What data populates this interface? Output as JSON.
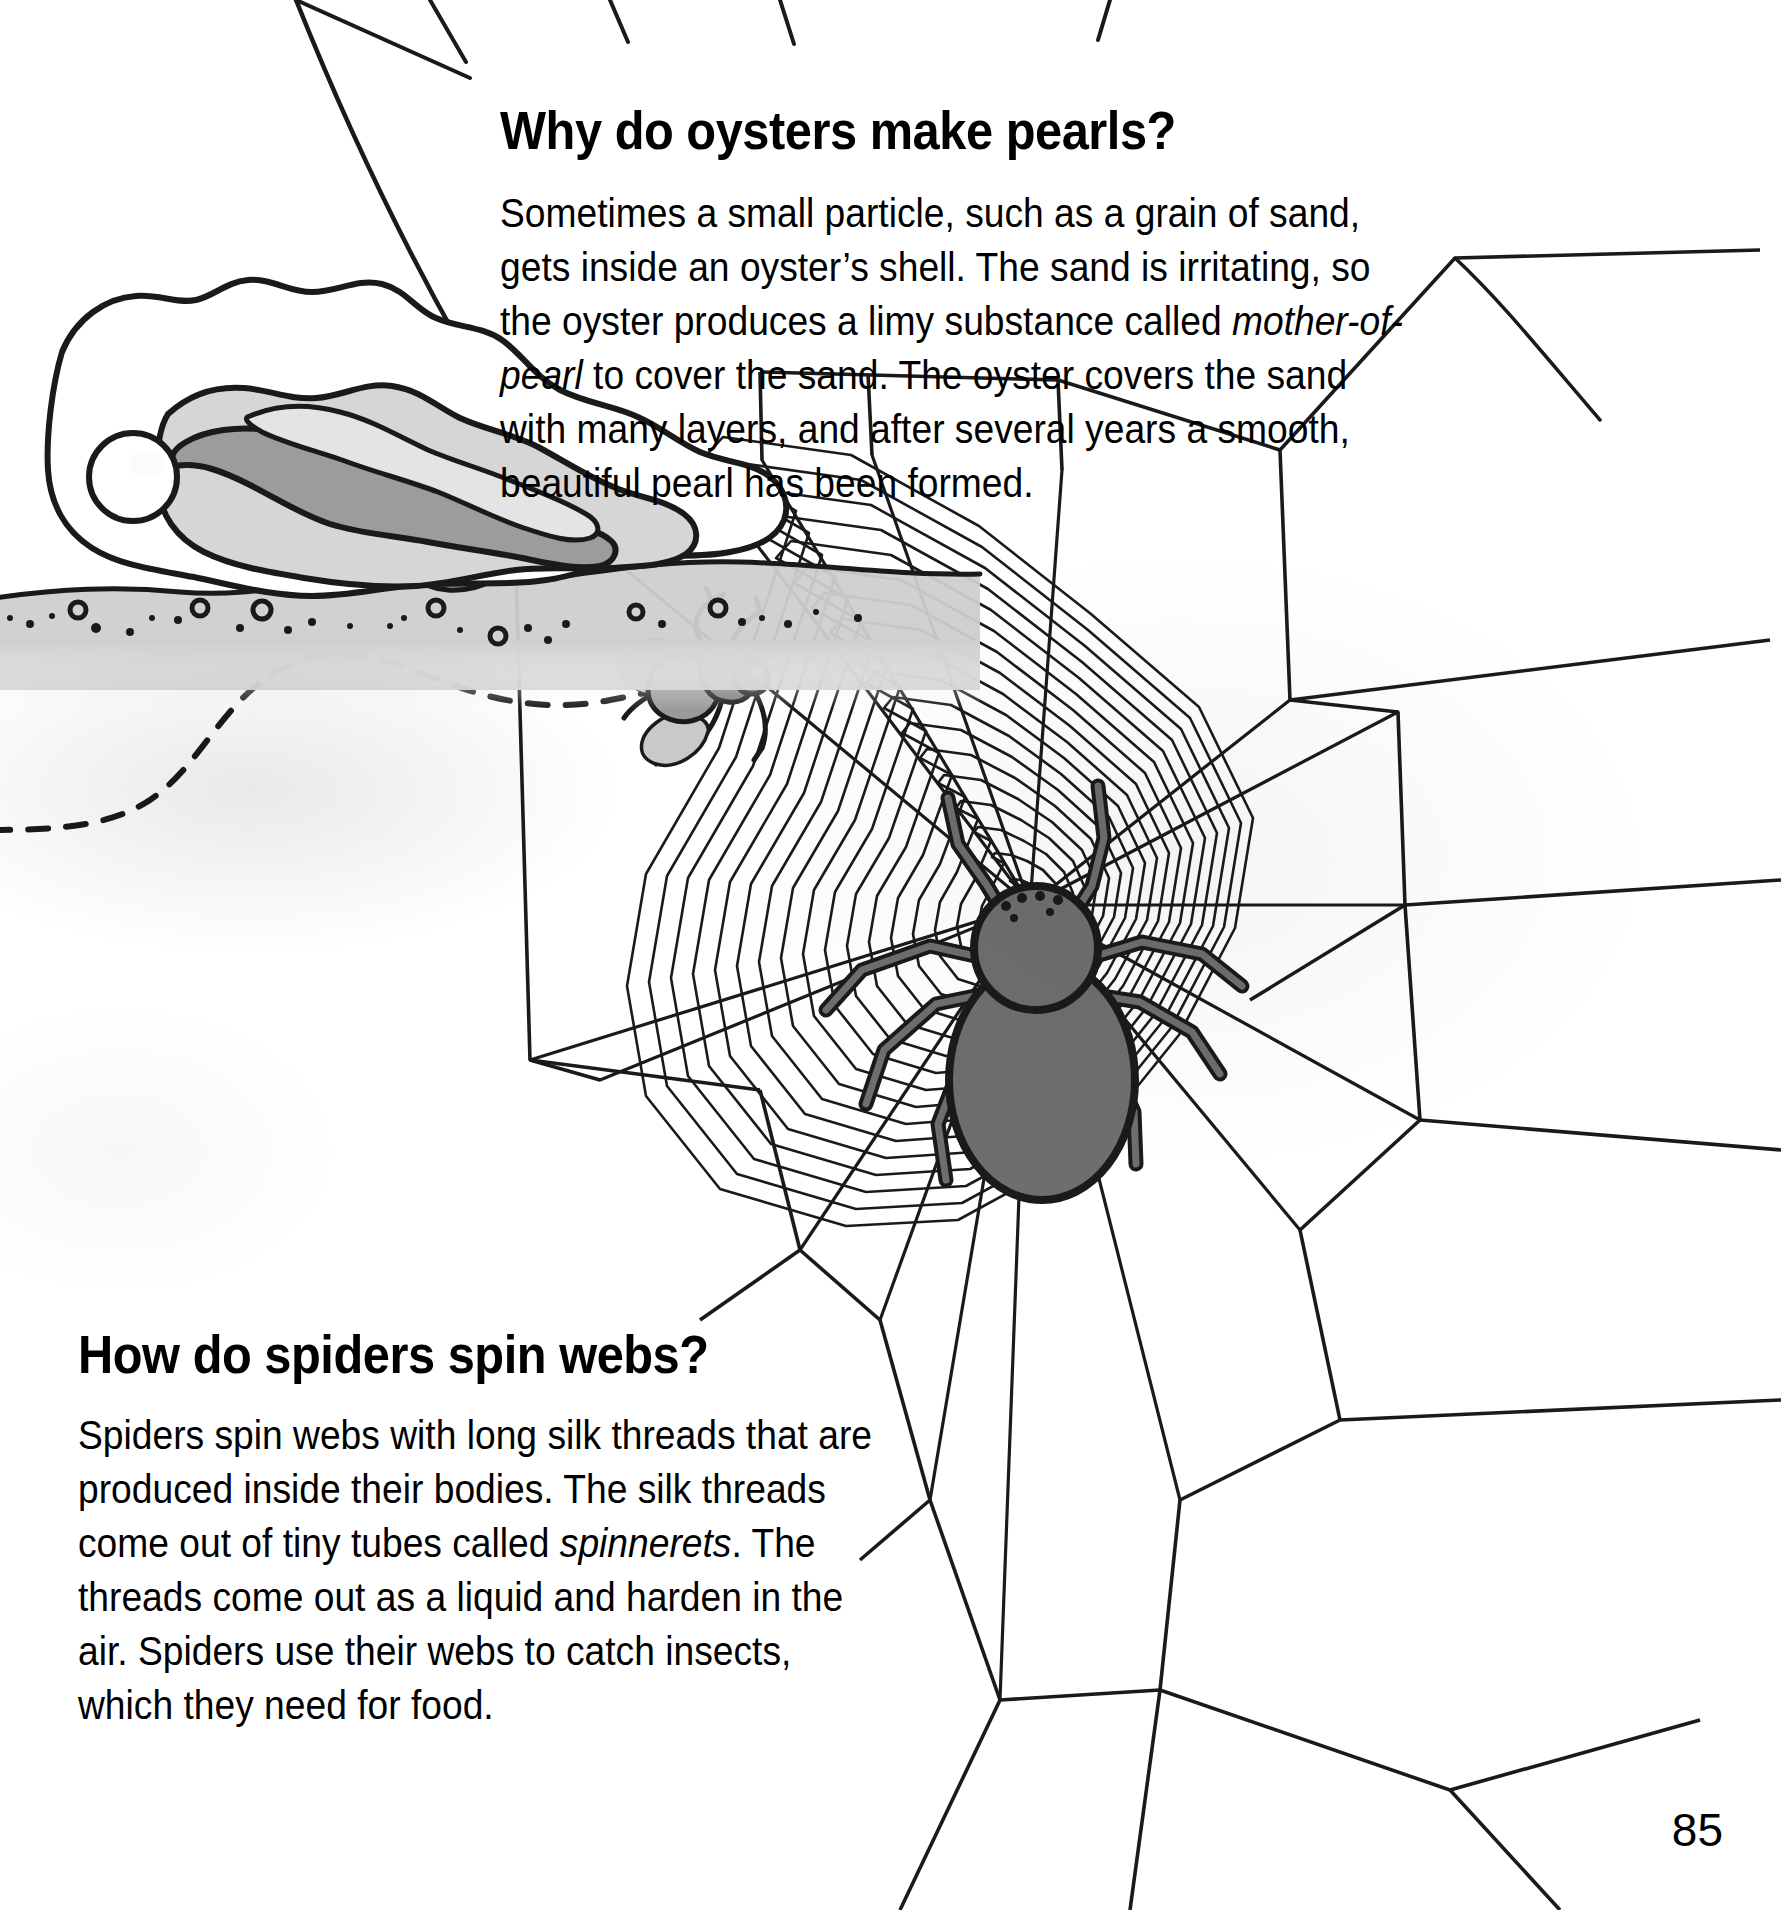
{
  "page": {
    "number": "85",
    "background_color": "#ffffff",
    "ink_color": "#000000"
  },
  "sections": [
    {
      "id": "oysters",
      "heading": "Why do oysters make pearls?",
      "body_plain": "Sometimes a small particle, such as a grain of sand, gets inside an oyster's shell. The sand is irritating, so the oyster produces a limy substance called mother-of-pearl to cover the sand. The oyster covers the sand with many layers, and after several years a smooth, beautiful pearl has been formed.",
      "body_parts": [
        {
          "text": "Sometimes a small particle, such as a grain of sand, gets inside an oyster’s shell. The sand is irritating, so the oyster produces a limy substance called ",
          "style": "normal"
        },
        {
          "text": "mother-of-pearl",
          "style": "italic"
        },
        {
          "text": " to cover the sand. The oyster covers the sand with many layers, and after several years a smooth, beautiful pearl has been formed.",
          "style": "normal"
        }
      ]
    },
    {
      "id": "spiders",
      "heading": "How do spiders spin webs?",
      "body_plain": "Spiders spin webs with long silk threads that are produced inside their bodies. The silk threads come out of tiny tubes called spinnerets. The threads come out as a liquid and harden in the air. Spiders use their webs to catch insects, which they need for food.",
      "body_parts": [
        {
          "text": "Spiders spin webs with long silk threads that are produced inside their bodies. The silk threads come out of tiny tubes called ",
          "style": "normal"
        },
        {
          "text": "spinnerets",
          "style": "italic"
        },
        {
          "text": ". The threads come out as a liquid and harden in the air. Spiders use their webs to catch insects, which they need for food.",
          "style": "normal"
        }
      ]
    }
  ],
  "illustrations": [
    {
      "name": "oyster-with-pearl",
      "description": "Open oyster shell resting on a sandy sea floor with a round white pearl inside near the hinge.",
      "parts": [
        "outer-shell",
        "inner-shell-lining",
        "oyster-flesh",
        "pearl",
        "sand-bed",
        "sand-pebbles"
      ],
      "colors": {
        "outline": "#1a1a1a",
        "shell_white": "#ffffff",
        "flesh_light_gray": "#d2d2d2",
        "flesh_mid_gray": "#a9a9a9",
        "flesh_dark_gray": "#8c8c8c",
        "sand_gray": "#cfcfcf",
        "pearl_white": "#ffffff"
      }
    },
    {
      "name": "spider-web-with-spider-and-fly",
      "description": "Large orb web made of radial spokes and concentric spiral threads, anchored by long lines running off the page. A dark gray spider sits at centre-left, and a gray fly is caught above it. A dashed wavy line shows the fly's flight path into the web.",
      "parts": [
        "anchor-threads",
        "radial-spokes",
        "spiral-threads",
        "frame-threads",
        "spider",
        "fly",
        "fly-flight-path"
      ],
      "colors": {
        "thread": "#1a1a1a",
        "spider_body": "#6e6e6e",
        "spider_outline": "#1a1a1a",
        "fly_body": "#8a8a8a",
        "fly_wing": "#c2c2c2"
      },
      "spider": {
        "legs": 8,
        "eyes": 6
      },
      "web": {
        "radial_spokes": 13,
        "spiral_rings": 22
      }
    }
  ]
}
